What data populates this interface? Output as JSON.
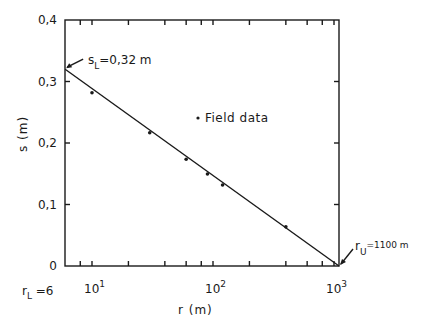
{
  "chart_data": {
    "type": "line",
    "title": "",
    "xlabel": "r (m)",
    "ylabel": "s (m)",
    "xscale": "log",
    "xlim": [
      6,
      1100
    ],
    "ylim": [
      0,
      0.4
    ],
    "grid": false,
    "y_ticks": [
      "0",
      "0,1",
      "0,2",
      "0,3",
      "0,4"
    ],
    "x_ticks": [
      {
        "base": "10",
        "exp": "1",
        "value": 10
      },
      {
        "base": "10",
        "exp": "2",
        "value": 100
      },
      {
        "base": "10",
        "exp": "3",
        "value": 1000
      }
    ],
    "x_extra_label": {
      "text": "r",
      "sub": "L",
      "rest": "=6",
      "value": 6
    },
    "legend": {
      "marker": "dot",
      "label": "Field data",
      "position": "inside upper right"
    },
    "series": [
      {
        "name": "Field data",
        "type": "scatter",
        "x": [
          10,
          30,
          60,
          90,
          120,
          400
        ],
        "y": [
          0.28,
          0.215,
          0.172,
          0.148,
          0.13,
          0.062
        ]
      },
      {
        "name": "Fitted line",
        "type": "line",
        "x": [
          6,
          1100
        ],
        "y": [
          0.32,
          0.0
        ]
      }
    ],
    "annotations": [
      {
        "text": "s",
        "sub": "L",
        "rest": "=0,32 m",
        "x": 6,
        "y": 0.32
      },
      {
        "text": "r",
        "sub": "U",
        "rest": "=1100 m",
        "x": 1100,
        "y": 0.0
      }
    ]
  }
}
